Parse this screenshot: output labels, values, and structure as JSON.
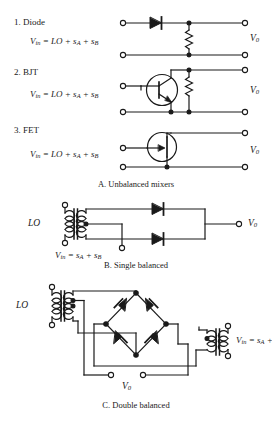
{
  "figure": {
    "sections": [
      {
        "id": "A",
        "caption": "A. Unbalanced mixers",
        "circuits": [
          {
            "number": "1.",
            "name": "Diode",
            "heading": "1. Diode",
            "equation": "V_in = LO + s_A + s_B",
            "eq_lhs": "V",
            "eq_lhs_sub": "in",
            "eq_rhs": " = LO + s",
            "eq_sub1": "A",
            "eq_mid": " + s",
            "eq_sub2": "B",
            "output_label": "V",
            "output_sub": "0",
            "devices": [
              "diode",
              "resistor"
            ]
          },
          {
            "number": "2.",
            "name": "BJT",
            "heading": "2. BJT",
            "equation": "V_in = LO + s_A + s_B",
            "eq_lhs": "V",
            "eq_lhs_sub": "in",
            "eq_rhs": " = LO + s",
            "eq_sub1": "A",
            "eq_mid": " + s",
            "eq_sub2": "B",
            "output_label": "V",
            "output_sub": "0",
            "devices": [
              "npn-bjt",
              "resistor"
            ]
          },
          {
            "number": "3.",
            "name": "FET",
            "heading": "3. FET",
            "equation": "V_in = LO + s_A + s_B",
            "eq_lhs": "V",
            "eq_lhs_sub": "in",
            "eq_rhs": " = LO + s",
            "eq_sub1": "A",
            "eq_mid": " + s",
            "eq_sub2": "B",
            "output_label": "V",
            "output_sub": "0",
            "devices": [
              "n-jfet"
            ]
          }
        ]
      },
      {
        "id": "B",
        "caption": "B. Single balanced",
        "lo_label": "LO",
        "input_eq_lhs": "V",
        "input_eq_lhs_sub": "in",
        "input_eq_rhs": " = s",
        "input_eq_sub1": "A",
        "input_eq_mid": " + s",
        "input_eq_sub2": "B",
        "output_label": "V",
        "output_sub": "0",
        "devices": [
          "transformer",
          "diode",
          "diode"
        ]
      },
      {
        "id": "C",
        "caption": "C. Double balanced",
        "lo_label": "LO",
        "input_eq_lhs": "V",
        "input_eq_lhs_sub": "in",
        "input_eq_rhs": " = s",
        "input_eq_sub1": "A",
        "input_eq_mid": " + s",
        "input_eq_sub2": "B",
        "output_label": "V",
        "output_sub": "0",
        "devices": [
          "transformer",
          "diode-ring",
          "transformer"
        ]
      }
    ],
    "colors": {
      "ink": "#1a1a1a",
      "background": "#ffffff"
    }
  }
}
